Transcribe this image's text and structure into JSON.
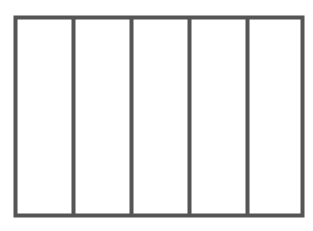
{
  "diagram": {
    "type": "rectangle-divided-into-equal-parts",
    "parts": 5,
    "stroke_color": "#555555",
    "background": "#ffffff",
    "outer_rect": {
      "x": 15,
      "y": 17,
      "width": 288,
      "height": 199
    },
    "dividers_x": [
      73,
      131,
      189,
      247
    ]
  }
}
